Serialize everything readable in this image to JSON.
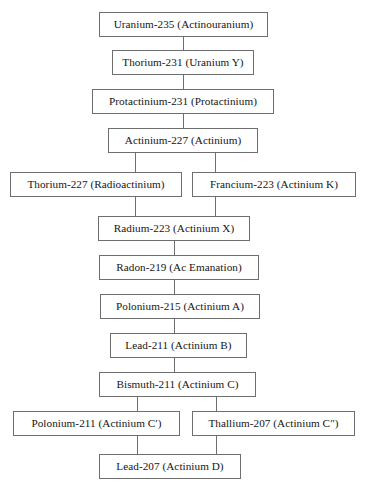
{
  "diagram": {
    "type": "flowchart",
    "orientation": "top-to-bottom",
    "background_color": "#ffffff",
    "border_color": "#6e6e6e",
    "text_color": "#151515",
    "nodes": [
      {
        "id": "u235",
        "label": "Uranium-235 (Actinouranium)",
        "x": 99,
        "y": 12,
        "w": 169,
        "h": 25
      },
      {
        "id": "th231",
        "label": "Thorium-231 (Uranium Y)",
        "x": 112,
        "y": 50,
        "w": 142,
        "h": 25
      },
      {
        "id": "pa231",
        "label": "Protactinium-231 (Protactinium)",
        "x": 92,
        "y": 89,
        "w": 182,
        "h": 25
      },
      {
        "id": "ac227",
        "label": "Actinium-227 (Actinium)",
        "x": 108,
        "y": 128,
        "w": 150,
        "h": 25
      },
      {
        "id": "th227",
        "label": "Thorium-227 (Radioactinium)",
        "x": 10,
        "y": 172,
        "w": 172,
        "h": 25
      },
      {
        "id": "fr223",
        "label": "Francium-223 (Actinium K)",
        "x": 192,
        "y": 172,
        "w": 164,
        "h": 25
      },
      {
        "id": "ra223",
        "label": "Radium-223 (Actinium X)",
        "x": 98,
        "y": 216,
        "w": 152,
        "h": 25
      },
      {
        "id": "rn219",
        "label": "Radon-219 (Ac Emanation)",
        "x": 99,
        "y": 255,
        "w": 160,
        "h": 25
      },
      {
        "id": "po215",
        "label": "Polonium-215 (Actinium A)",
        "x": 100,
        "y": 294,
        "w": 160,
        "h": 25
      },
      {
        "id": "pb211",
        "label": "Lead-211 (Actinium B)",
        "x": 110,
        "y": 333,
        "w": 137,
        "h": 25
      },
      {
        "id": "bi211",
        "label": "Bismuth-211 (Actinium C)",
        "x": 99,
        "y": 372,
        "w": 157,
        "h": 25
      },
      {
        "id": "po211",
        "label": "Polonium-211 (Actinium C′)",
        "x": 13,
        "y": 411,
        "w": 167,
        "h": 25
      },
      {
        "id": "tl207",
        "label": "Thallium-207 (Actinium C″)",
        "x": 192,
        "y": 411,
        "w": 163,
        "h": 25
      },
      {
        "id": "pb207",
        "label": "Lead-207 (Actinium D)",
        "x": 99,
        "y": 454,
        "w": 142,
        "h": 25
      }
    ],
    "connectors": [
      {
        "from": "u235",
        "to": "th231",
        "orient": "v",
        "x": 183,
        "y": 37,
        "len": 13
      },
      {
        "from": "th231",
        "to": "pa231",
        "orient": "v",
        "x": 183,
        "y": 75,
        "len": 14
      },
      {
        "from": "pa231",
        "to": "ac227",
        "orient": "v",
        "x": 183,
        "y": 114,
        "len": 14
      },
      {
        "from": "ac227",
        "to": "th227",
        "orient": "v",
        "x": 135,
        "y": 153,
        "len": 19
      },
      {
        "from": "ac227",
        "to": "fr223",
        "orient": "v",
        "x": 215,
        "y": 153,
        "len": 19
      },
      {
        "from": "th227",
        "to": "ra223",
        "orient": "v",
        "x": 135,
        "y": 197,
        "len": 19
      },
      {
        "from": "fr223",
        "to": "ra223",
        "orient": "v",
        "x": 215,
        "y": 197,
        "len": 19
      },
      {
        "from": "ra223",
        "to": "rn219",
        "orient": "v",
        "x": 174,
        "y": 241,
        "len": 14
      },
      {
        "from": "rn219",
        "to": "po215",
        "orient": "v",
        "x": 174,
        "y": 280,
        "len": 14
      },
      {
        "from": "po215",
        "to": "pb211",
        "orient": "v",
        "x": 174,
        "y": 319,
        "len": 14
      },
      {
        "from": "pb211",
        "to": "bi211",
        "orient": "v",
        "x": 174,
        "y": 358,
        "len": 14
      },
      {
        "from": "bi211",
        "to": "po211",
        "orient": "v",
        "x": 137,
        "y": 397,
        "len": 14
      },
      {
        "from": "bi211",
        "to": "tl207",
        "orient": "v",
        "x": 216,
        "y": 397,
        "len": 14
      },
      {
        "from": "po211",
        "to": "pb207",
        "orient": "v",
        "x": 137,
        "y": 436,
        "len": 18
      },
      {
        "from": "tl207",
        "to": "pb207",
        "orient": "v",
        "x": 216,
        "y": 436,
        "len": 18
      }
    ]
  }
}
